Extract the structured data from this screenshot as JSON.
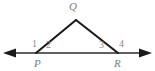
{
  "figure": {
    "type": "geometry-diagram",
    "colors": {
      "stroke": "#1a1a1a",
      "baseline": "#2b2b2b",
      "vertex_label": "#7a7a7a",
      "angle_label": "#8a8a8a",
      "background": "#ffffff"
    },
    "vertices": [
      {
        "name": "P",
        "label": "P",
        "x": 36,
        "y": 53
      },
      {
        "name": "Q",
        "label": "Q",
        "x": 76,
        "y": 20
      },
      {
        "name": "R",
        "label": "R",
        "x": 118,
        "y": 53
      }
    ],
    "baseline": {
      "name": "line-PR-extended",
      "x1": 5,
      "y1": 53,
      "x2": 150,
      "y2": 53,
      "arrow_left": true,
      "arrow_right": true
    },
    "segments": [
      {
        "name": "segment-PQ",
        "from": "P",
        "to": "Q"
      },
      {
        "name": "segment-QR",
        "from": "Q",
        "to": "R"
      }
    ],
    "angles": [
      {
        "id": "1",
        "label": "1",
        "at": "P",
        "kind": "exterior-left"
      },
      {
        "id": "2",
        "label": "2",
        "at": "P",
        "kind": "interior"
      },
      {
        "id": "3",
        "label": "3",
        "at": "R",
        "kind": "interior"
      },
      {
        "id": "4",
        "label": "4",
        "at": "R",
        "kind": "exterior-right"
      }
    ]
  }
}
